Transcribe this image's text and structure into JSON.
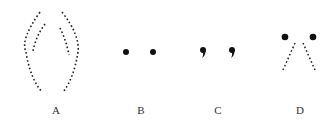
{
  "diagram": {
    "panels": [
      {
        "label": "A",
        "shape": "two-pairs-of-dashed-arcs",
        "label_x": 46
      },
      {
        "label": "B",
        "shape": "two-dots",
        "label_x": 131
      },
      {
        "label": "C",
        "shape": "two-commas",
        "label_x": 208
      },
      {
        "label": "D",
        "shape": "two-dots-with-dashed-lines",
        "label_x": 290
      }
    ],
    "colors": {
      "ink": "#111111",
      "label": "#333333",
      "background": "#ffffff"
    }
  }
}
